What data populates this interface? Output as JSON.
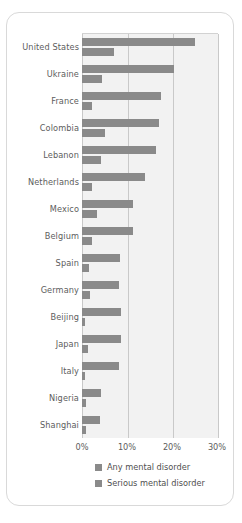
{
  "chart_data": {
    "type": "bar",
    "orientation": "horizontal",
    "title": "",
    "xlabel": "",
    "ylabel": "",
    "xlim": [
      0,
      30
    ],
    "xunit": "%",
    "grid": true,
    "legend_position": "bottom",
    "xticks": [
      "0%",
      "10%",
      "20%",
      "30%"
    ],
    "xtick_values": [
      0,
      10,
      20,
      30
    ],
    "categories": [
      "United States",
      "Ukraine",
      "France",
      "Colombia",
      "Lebanon",
      "Netherlands",
      "Mexico",
      "Belgium",
      "Spain",
      "Germany",
      "Beijing",
      "Japan",
      "Italy",
      "Nigeria",
      "Shanghai"
    ],
    "series": [
      {
        "name": "Any mental disorder",
        "color": "#8a8a8a",
        "values": [
          25.0,
          20.5,
          17.5,
          17.0,
          16.5,
          14.0,
          11.3,
          11.3,
          8.5,
          8.2,
          8.7,
          8.7,
          8.2,
          4.2,
          4.0
        ]
      },
      {
        "name": "Serious mental disorder",
        "color": "#8a8a8a",
        "values": [
          7.0,
          4.5,
          2.3,
          5.2,
          4.3,
          2.3,
          3.3,
          2.3,
          1.6,
          1.8,
          0.7,
          1.3,
          0.7,
          0.9,
          0.9
        ]
      }
    ]
  },
  "legend": {
    "items": [
      {
        "label": "Any mental disorder"
      },
      {
        "label": "Serious mental disorder"
      }
    ]
  }
}
